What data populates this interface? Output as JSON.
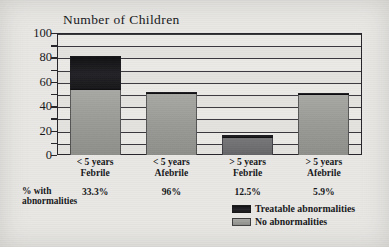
{
  "chart_data": {
    "type": "bar",
    "subtype": "stacked-bar",
    "title": "Number of Children",
    "xlabel": "",
    "ylabel": "Number of Children",
    "ylim": [
      0,
      100
    ],
    "ytick_labels": [
      "0",
      "20",
      "40",
      "60",
      "80",
      "100"
    ],
    "ytick_values": [
      0,
      20,
      40,
      60,
      80,
      100
    ],
    "gridline_interval": 10,
    "grid": true,
    "legend_position": "bottom-right",
    "categories": [
      "< 5 years Febrile",
      "< 5 years Afebrile",
      "> 5 years Febrile",
      "> 5 years Afebrile"
    ],
    "category_lines": [
      [
        "< 5 years",
        "Febrile"
      ],
      [
        "< 5 years",
        "Afebrile"
      ],
      [
        "> 5 years",
        "Febrile"
      ],
      [
        "> 5 years",
        "Afebrile"
      ]
    ],
    "series": [
      {
        "name": "No abnormalities",
        "color": "#9d9d99",
        "values": [
          53,
          50,
          14,
          49
        ]
      },
      {
        "name": "Treatable abnormalities",
        "color": "#1b1b1e",
        "values": [
          28,
          2,
          2,
          2
        ]
      }
    ],
    "totals": [
      81,
      52,
      16,
      51
    ],
    "annotation_row": {
      "caption_lines": [
        "% with",
        "abnormalities"
      ],
      "values": [
        "33.3%",
        "96%",
        "12.5%",
        "5.9%"
      ]
    }
  },
  "legend": {
    "items": [
      {
        "label": "Treatable abnormalities",
        "swatch": "dark"
      },
      {
        "label": "No abnormalities",
        "swatch": "gray"
      }
    ]
  }
}
